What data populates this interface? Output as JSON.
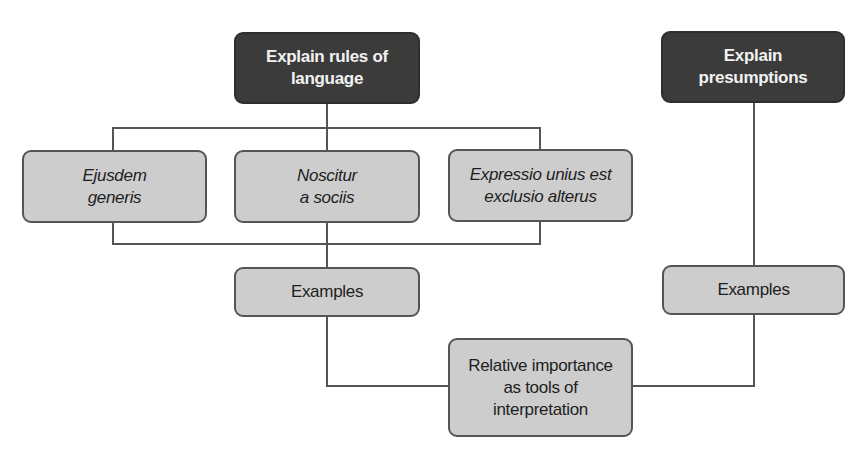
{
  "diagram": {
    "nodes": {
      "rules_of_language": {
        "label": "Explain rules of\nlanguage",
        "style": "dark"
      },
      "presumptions": {
        "label": "Explain\npresumptions",
        "style": "dark"
      },
      "ejusdem_generis": {
        "label": "Ejusdem\ngeneris",
        "style": "light-italic"
      },
      "noscitur_a_sociis": {
        "label": "Noscitur\na sociis",
        "style": "light-italic"
      },
      "expressio_unius": {
        "label": "Expressio unius est\nexclusio alterus",
        "style": "light-italic"
      },
      "examples_rules": {
        "label": "Examples",
        "style": "light"
      },
      "examples_presumptions": {
        "label": "Examples",
        "style": "light"
      },
      "relative_importance": {
        "label": "Relative importance\nas tools of\ninterpretation",
        "style": "light"
      }
    },
    "edges": [
      {
        "from": "rules_of_language",
        "to": "ejusdem_generis"
      },
      {
        "from": "rules_of_language",
        "to": "noscitur_a_sociis"
      },
      {
        "from": "rules_of_language",
        "to": "expressio_unius"
      },
      {
        "from": "ejusdem_generis",
        "to": "examples_rules"
      },
      {
        "from": "noscitur_a_sociis",
        "to": "examples_rules"
      },
      {
        "from": "expressio_unius",
        "to": "examples_rules"
      },
      {
        "from": "examples_rules",
        "to": "relative_importance"
      },
      {
        "from": "presumptions",
        "to": "examples_presumptions"
      },
      {
        "from": "examples_presumptions",
        "to": "relative_importance"
      }
    ],
    "colors": {
      "dark_fill": "#3b3b3b",
      "light_fill": "#cdcdcd",
      "line": "#555555",
      "dark_text": "#f2f2f2",
      "light_text": "#1e1e1e"
    }
  }
}
